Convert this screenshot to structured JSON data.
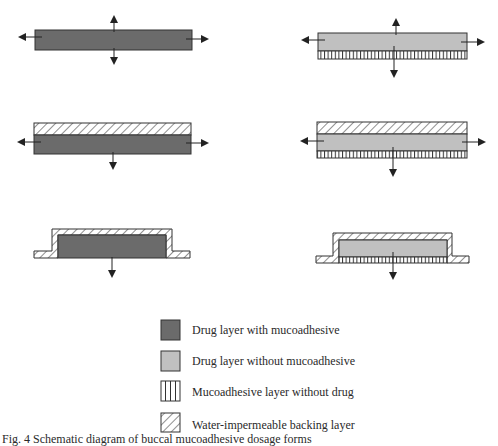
{
  "colors": {
    "drug_with_mucoadhesive": "#6b6b6b",
    "drug_without_mucoadhesive": "#c0c0c0",
    "outline": "#333333",
    "arrow": "#222222"
  },
  "panels": [
    {
      "id": "a",
      "position": "top-left",
      "layers": [
        "drug_with_mucoadhesive"
      ],
      "release_directions": [
        "up",
        "down",
        "left",
        "right"
      ]
    },
    {
      "id": "b",
      "position": "top-right",
      "layers": [
        "drug_without_mucoadhesive",
        "mucoadhesive_without_drug"
      ],
      "release_directions": [
        "up",
        "down",
        "left",
        "right"
      ]
    },
    {
      "id": "c",
      "position": "middle-left",
      "layers": [
        "backing",
        "drug_with_mucoadhesive"
      ],
      "release_directions": [
        "down",
        "left",
        "right"
      ]
    },
    {
      "id": "d",
      "position": "middle-right",
      "layers": [
        "backing",
        "drug_without_mucoadhesive",
        "mucoadhesive_without_drug"
      ],
      "release_directions": [
        "down",
        "left",
        "right"
      ]
    },
    {
      "id": "e",
      "position": "bottom-left",
      "layers": [
        "backing_enclosing",
        "drug_with_mucoadhesive"
      ],
      "release_directions": [
        "down"
      ]
    },
    {
      "id": "f",
      "position": "bottom-right",
      "layers": [
        "backing_enclosing",
        "drug_without_mucoadhesive",
        "mucoadhesive_without_drug"
      ],
      "release_directions": [
        "down"
      ]
    }
  ],
  "legend": {
    "items": [
      {
        "key": "drug_with_mucoadhesive",
        "label": "Drug layer with mucoadhesive"
      },
      {
        "key": "drug_without_mucoadhesive",
        "label": "Drug layer without mucoadhesive"
      },
      {
        "key": "mucoadhesive_without_drug",
        "label": "Mucoadhesive layer without drug"
      },
      {
        "key": "backing",
        "label": "Water-impermeable backing layer"
      }
    ]
  },
  "caption": {
    "text": "Fig. 4  Schematic diagram of buccal mucoadhesive dosage forms"
  }
}
